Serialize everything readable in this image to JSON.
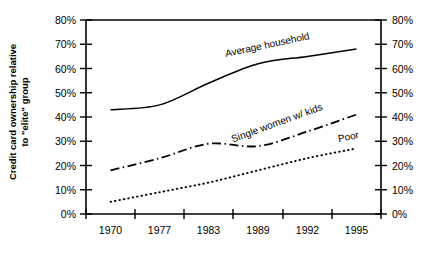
{
  "chart_data": {
    "type": "line",
    "title": "",
    "xlabel": "",
    "ylabel": "Credit card ownership relative to \"elite\" group",
    "ylabel_line1": "Credit card ownership relative",
    "ylabel_line2": "to \"elite\" group",
    "categories": [
      "1970",
      "1977",
      "1983",
      "1989",
      "1992",
      "1995"
    ],
    "ylim": [
      0,
      80
    ],
    "ytick_values": [
      0,
      10,
      20,
      30,
      40,
      50,
      60,
      70,
      80
    ],
    "ytick_labels": [
      "0%",
      "10%",
      "20%",
      "30%",
      "40%",
      "50%",
      "60%",
      "70%",
      "80%"
    ],
    "right_axis": true,
    "right_ytick_labels": [
      "0%",
      "10%",
      "20%",
      "30%",
      "40%",
      "50%",
      "60%",
      "70%",
      "80%"
    ],
    "grid": false,
    "legend_position": "inline-on-curve",
    "series": [
      {
        "name": "Average household",
        "style": "solid",
        "values": [
          43,
          45,
          54,
          62,
          65,
          68
        ],
        "label": "Average household"
      },
      {
        "name": "Single women w/ kids",
        "style": "dash-dot",
        "values": [
          18,
          23,
          29,
          28,
          34,
          41
        ],
        "label": "Single women w/ kids"
      },
      {
        "name": "Poor",
        "style": "dotted",
        "values": [
          5,
          9,
          13,
          18,
          23,
          27
        ],
        "label": "Poor"
      }
    ]
  },
  "axis": {
    "y_left_ticks": [
      "80%",
      "70%",
      "60%",
      "50%",
      "40%",
      "30%",
      "20%",
      "10%",
      "0%"
    ],
    "y_right_ticks": [
      "80%",
      "70%",
      "60%",
      "50%",
      "40%",
      "30%",
      "20%",
      "10%",
      "0%"
    ],
    "x_ticks": [
      "1970",
      "1977",
      "1983",
      "1989",
      "1992",
      "1995"
    ]
  },
  "labels": {
    "y_axis_title_line1": "Credit card ownership relative",
    "y_axis_title_line2": "to \"elite\" group",
    "series_average": "Average household",
    "series_single_women": "Single women w/ kids",
    "series_poor": "Poor"
  },
  "colors": {
    "line": "#000000",
    "axis": "#000000",
    "background": "#ffffff"
  }
}
